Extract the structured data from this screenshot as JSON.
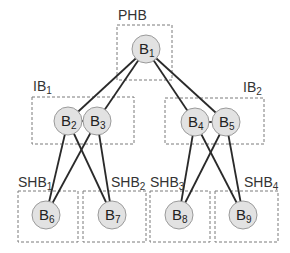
{
  "diagram": {
    "groups": [
      {
        "id": "PHB",
        "label": "PHB",
        "sub": "",
        "box": [
          117,
          25,
          55,
          55
        ],
        "label_pos": [
          118,
          20
        ]
      },
      {
        "id": "IB1",
        "label": "IB",
        "sub": "1",
        "box": [
          32,
          97,
          102,
          47
        ],
        "label_pos": [
          33,
          91
        ]
      },
      {
        "id": "IB2",
        "label": "IB",
        "sub": "2",
        "box": [
          165,
          98,
          99,
          46
        ],
        "label_pos": [
          243,
          92
        ]
      },
      {
        "id": "SHB1",
        "label": "SHB",
        "sub": "1",
        "box": [
          18,
          191,
          60,
          51
        ],
        "label_pos": [
          18,
          187
        ]
      },
      {
        "id": "SHB2",
        "label": "SHB",
        "sub": "2",
        "box": [
          83,
          191,
          63,
          51
        ],
        "label_pos": [
          111,
          187
        ]
      },
      {
        "id": "SHB3",
        "label": "SHB",
        "sub": "3",
        "box": [
          150,
          191,
          60,
          51
        ],
        "label_pos": [
          150,
          187
        ]
      },
      {
        "id": "SHB4",
        "label": "SHB",
        "sub": "4",
        "box": [
          215,
          191,
          63,
          51
        ],
        "label_pos": [
          244,
          187
        ]
      }
    ],
    "nodes": [
      {
        "id": "B1",
        "label": "B",
        "sub": "1",
        "x": 146,
        "y": 49
      },
      {
        "id": "B2",
        "label": "B",
        "sub": "2",
        "x": 68,
        "y": 121
      },
      {
        "id": "B3",
        "label": "B",
        "sub": "3",
        "x": 97,
        "y": 121
      },
      {
        "id": "B4",
        "label": "B",
        "sub": "4",
        "x": 195,
        "y": 122
      },
      {
        "id": "B5",
        "label": "B",
        "sub": "5",
        "x": 226,
        "y": 122
      },
      {
        "id": "B6",
        "label": "B",
        "sub": "6",
        "x": 46,
        "y": 215
      },
      {
        "id": "B7",
        "label": "B",
        "sub": "7",
        "x": 112,
        "y": 215
      },
      {
        "id": "B8",
        "label": "B",
        "sub": "8",
        "x": 179,
        "y": 215
      },
      {
        "id": "B9",
        "label": "B",
        "sub": "9",
        "x": 243,
        "y": 215
      }
    ],
    "edges": [
      [
        "B1",
        "B2"
      ],
      [
        "B1",
        "B3"
      ],
      [
        "B1",
        "B4"
      ],
      [
        "B1",
        "B5"
      ],
      [
        "B2",
        "B3"
      ],
      [
        "B4",
        "B5"
      ],
      [
        "B2",
        "B6"
      ],
      [
        "B2",
        "B7"
      ],
      [
        "B3",
        "B6"
      ],
      [
        "B3",
        "B7"
      ],
      [
        "B4",
        "B8"
      ],
      [
        "B4",
        "B9"
      ],
      [
        "B5",
        "B8"
      ],
      [
        "B5",
        "B9"
      ]
    ],
    "node_radius": 14
  }
}
